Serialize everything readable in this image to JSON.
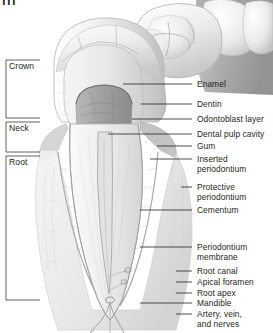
{
  "figure": {
    "corner_mark": "|||",
    "background_color": "#ffffff",
    "line_color": "#231f20",
    "text_color": "#231f20"
  },
  "brackets": [
    {
      "label": "Crown",
      "top": 60,
      "bottom": 118
    },
    {
      "label": "Neck",
      "top": 122,
      "bottom": 152
    },
    {
      "label": "Root",
      "top": 156,
      "bottom": 300
    }
  ],
  "callouts": [
    {
      "label": "Enamel",
      "text_y": 80,
      "line_y": 84,
      "line_x1": 123,
      "line_x2": 192,
      "lines": 1
    },
    {
      "label": "Dentin",
      "text_y": 100,
      "line_y": 104,
      "line_x1": 141,
      "line_x2": 192,
      "lines": 1
    },
    {
      "label": "Odontoblast layer",
      "text_y": 115,
      "line_y": 119,
      "line_x1": 132,
      "line_x2": 192,
      "lines": 1
    },
    {
      "label": "Dental pulp cavity",
      "text_y": 130,
      "line_y": 134,
      "line_x1": 108,
      "line_x2": 192,
      "lines": 1
    },
    {
      "label": "Gum",
      "text_y": 142,
      "line_y": 146,
      "line_x1": 157,
      "line_x2": 192,
      "lines": 1
    },
    {
      "label": "Inserted",
      "label2": "periodontium",
      "text_y": 155,
      "line_y": 159,
      "line_x1": 150,
      "line_x2": 192,
      "lines": 2
    },
    {
      "label": "Protective",
      "label2": "periodontium",
      "text_y": 183,
      "line_y": 187,
      "line_x1": 181,
      "line_x2": 192,
      "lines": 2
    },
    {
      "label": "Cementum",
      "text_y": 206,
      "line_y": 210,
      "line_x1": 140,
      "line_x2": 192,
      "lines": 1
    },
    {
      "label": "Periodontium",
      "label2": "membrane",
      "text_y": 243,
      "line_y": 247,
      "line_x1": 140,
      "line_x2": 192,
      "lines": 2
    },
    {
      "label": "Root canal",
      "text_y": 267,
      "line_y": 271,
      "line_x1": 176,
      "line_x2": 192,
      "lines": 1
    },
    {
      "label": "Apical foramen",
      "text_y": 278,
      "line_y": 282,
      "line_x1": 176,
      "line_x2": 192,
      "lines": 1
    },
    {
      "label": "Root apex",
      "text_y": 289,
      "line_y": 293,
      "line_x1": 176,
      "line_x2": 192,
      "lines": 1
    },
    {
      "label": "Mandible",
      "text_y": 299,
      "line_y": 303,
      "line_x1": 140,
      "line_x2": 192,
      "lines": 1
    },
    {
      "label": "Artery, vein,",
      "label2": "and nerves",
      "text_y": 310,
      "line_y": 314,
      "line_x1": 176,
      "line_x2": 192,
      "lines": 2
    }
  ],
  "anatomy_regions": [
    {
      "name": "occlusal-molar-row",
      "description": "Row of molar crowns in perspective across the top"
    },
    {
      "name": "enamel",
      "description": "Outer pale shell of the crown"
    },
    {
      "name": "dentin",
      "description": "Body layer beneath enamel"
    },
    {
      "name": "dental-pulp-cavity",
      "description": "Dark chamber inside the crown"
    },
    {
      "name": "gum-tissue",
      "description": "Darker gray gingiva at the neck"
    },
    {
      "name": "root",
      "description": "Tapering root with central root canal"
    },
    {
      "name": "apical-foramen",
      "description": "Opening at the root tip"
    },
    {
      "name": "neurovascular-bundle",
      "description": "Artery, vein and nerve strands below the apex"
    }
  ]
}
